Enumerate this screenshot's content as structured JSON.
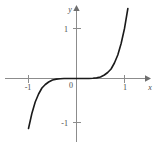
{
  "figure": {
    "background_color": "#ffffff",
    "width": 156,
    "height": 147
  },
  "chart_data": {
    "type": "line",
    "title": "",
    "subtitle": "",
    "xlabel": "x",
    "ylabel": "y",
    "function": "y = x^5",
    "xlim": [
      -1.5,
      1.55
    ],
    "ylim": [
      -1.65,
      1.6
    ],
    "xticks": [
      -1,
      1
    ],
    "xtick_labels": [
      "-1",
      "1"
    ],
    "yticks": [
      1,
      -1
    ],
    "ytick_labels": [
      "1",
      "-1"
    ],
    "origin_label": "0",
    "grid": false,
    "legend": false,
    "legend_position": "none",
    "axis_color": "#8c8c8c",
    "curve_color": "#1a1a1a",
    "label_color": "#4a4a4a",
    "x": [
      -1.42,
      -1.35,
      -1.28,
      -1.21,
      -1.14,
      -1.07,
      -1.0,
      -0.93,
      -0.86,
      -0.79,
      -0.72,
      -0.65,
      -0.58,
      -0.5,
      -0.42,
      -0.34,
      -0.26,
      -0.18,
      -0.1,
      0.0,
      0.1,
      0.18,
      0.26,
      0.34,
      0.42,
      0.5,
      0.58,
      0.65,
      0.72,
      0.79,
      0.86,
      0.93,
      1.0,
      1.07,
      1.14,
      1.21,
      1.28,
      1.35,
      1.42
    ],
    "y": [
      -5.79,
      -4.48,
      -3.44,
      -2.6,
      -1.93,
      -1.4,
      -1.0,
      -0.7,
      -0.47,
      -0.31,
      -0.19,
      -0.12,
      -0.07,
      -0.03,
      -0.013,
      -0.0045,
      -0.0012,
      -0.0002,
      0.0,
      0.0,
      0.0,
      0.0002,
      0.0012,
      0.0045,
      0.013,
      0.03,
      0.07,
      0.12,
      0.19,
      0.31,
      0.47,
      0.7,
      1.0,
      1.4,
      1.93,
      2.6,
      3.44,
      4.48,
      5.79
    ],
    "key_points": [
      {
        "x": -1,
        "y": -1
      },
      {
        "x": 0,
        "y": 0
      },
      {
        "x": 1,
        "y": 1
      }
    ]
  }
}
